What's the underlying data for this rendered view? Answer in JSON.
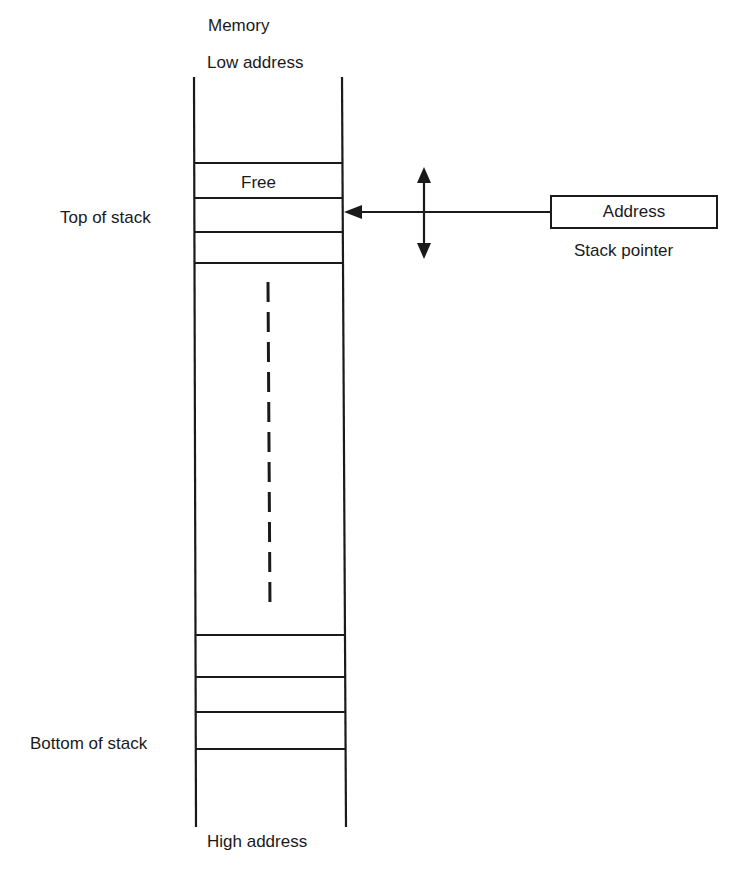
{
  "diagram": {
    "column_header": "Memory",
    "top_label": "Low address",
    "bottom_label": "High address",
    "free_cell_label": "Free",
    "left_labels": {
      "top_of_stack": "Top of stack",
      "bottom_of_stack": "Bottom of stack"
    },
    "register": {
      "value_label": "Address",
      "name_label": "Stack pointer"
    },
    "icons": {
      "pointer_arrow": "arrow-left-icon",
      "movement_arrow": "double-arrow-vertical-icon",
      "continuation": "dashed-line-icon"
    },
    "colors": {
      "ink": "#1a1a1a",
      "background": "#ffffff"
    }
  }
}
